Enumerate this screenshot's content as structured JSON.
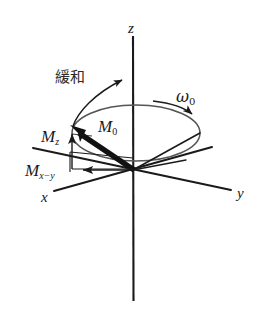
{
  "figure": {
    "title": "",
    "type": "vector-diagram",
    "background_color": "#ffffff",
    "stroke_color": "#1a1a1a",
    "ellipse_color": "#555555"
  },
  "axes": [
    {
      "name": "z-axis",
      "label": "z",
      "orientation": "vertical"
    },
    {
      "name": "y-axis",
      "label": "y",
      "orientation": "oblique-right"
    },
    {
      "name": "x-axis",
      "label": "x",
      "orientation": "oblique-left"
    }
  ],
  "labels": {
    "z": "z",
    "y": "y",
    "x": "x",
    "m_total": {
      "base": "M",
      "sub": "0"
    },
    "m_z": {
      "base": "M",
      "sub": "z"
    },
    "m_xy": {
      "base": "M",
      "sub": "x−y"
    },
    "relaxation": "緩和",
    "omega": {
      "base": "ω",
      "sub": "0"
    }
  },
  "vectors": [
    {
      "name": "m0-vector",
      "label": "M0",
      "style": "thick-solid",
      "from": "origin",
      "to": "cone-rim-upper-left"
    },
    {
      "name": "mz-component",
      "label": "Mz",
      "style": "thin-solid",
      "direction": "up"
    },
    {
      "name": "mxy-component",
      "label": "Mx−y",
      "style": "thin-solid",
      "direction": "left"
    }
  ],
  "annotations": [
    {
      "name": "relaxation-arrow",
      "label": "緩和",
      "style": "curved-arrow",
      "direction": "up-right"
    },
    {
      "name": "precession-arrow",
      "label": "ω0",
      "style": "curved-arrow",
      "direction": "clockwise"
    }
  ],
  "shapes": [
    {
      "name": "precession-ellipse",
      "type": "ellipse",
      "color": "#555555"
    },
    {
      "name": "cone-edges",
      "type": "lines"
    }
  ]
}
